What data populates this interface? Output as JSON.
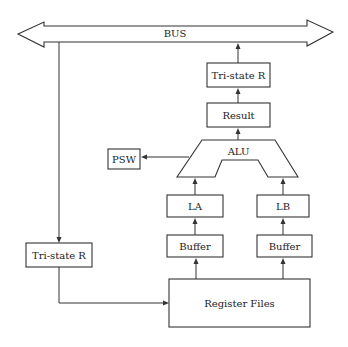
{
  "diagram": {
    "bus": {
      "label": "BUS"
    },
    "tristate_top": {
      "label": "Tri-state R"
    },
    "result": {
      "label": "Result"
    },
    "alu": {
      "label": "ALU"
    },
    "psw": {
      "label": "PSW"
    },
    "la": {
      "label": "LA"
    },
    "lb": {
      "label": "LB"
    },
    "buffer_left": {
      "label": "Buffer"
    },
    "buffer_right": {
      "label": "Buffer"
    },
    "tristate_left": {
      "label": "Tri-state R"
    },
    "register_files": {
      "label": "Register Files"
    }
  },
  "colors": {
    "stroke": "#333333",
    "background": "#ffffff",
    "text": "#222222"
  }
}
